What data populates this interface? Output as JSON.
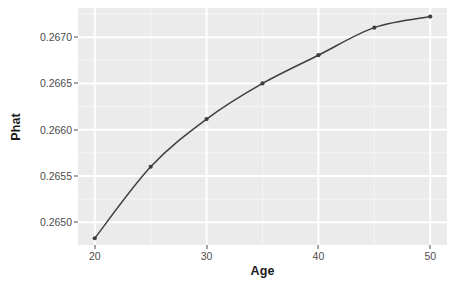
{
  "chart_data": {
    "type": "line",
    "title": "",
    "subtitle": "",
    "xlabel": "Age",
    "ylabel": "Phat",
    "xlim": [
      18.5,
      51.5
    ],
    "ylim": [
      0.264755,
      0.267315
    ],
    "xticks": [
      20,
      30,
      40,
      50
    ],
    "xtick_labels": [
      "20",
      "30",
      "40",
      "50"
    ],
    "yticks": [
      0.265,
      0.2655,
      0.266,
      0.2665,
      0.267
    ],
    "ytick_labels": [
      "0.2650",
      "0.2655",
      "0.2660",
      "0.2665",
      "0.2670"
    ],
    "x_minor_ticks": [
      25,
      35,
      45
    ],
    "y_minor_ticks": [
      0.26475,
      0.26525,
      0.26575,
      0.26625,
      0.26675,
      0.26725
    ],
    "grid": true,
    "legend": "none",
    "x": [
      20,
      25,
      30,
      35,
      40,
      45,
      50
    ],
    "values": [
      0.264828,
      0.2656,
      0.266115,
      0.2665,
      0.266805,
      0.267103,
      0.267222
    ],
    "series": [
      {
        "name": "Phat",
        "x": [
          20,
          25,
          30,
          35,
          40,
          45,
          50
        ],
        "values": [
          0.264828,
          0.2656,
          0.266115,
          0.2665,
          0.266805,
          0.267103,
          0.267222
        ],
        "line_color": "#3f3f3f",
        "point_color": "#3f3f3f",
        "point_shape": "circle"
      }
    ],
    "annotations": []
  },
  "style": {
    "panel_background": "#ebebeb",
    "plot_background": "#ffffff",
    "gridline_major_color": "#ffffff",
    "gridline_minor_color": "#f6f6f6",
    "axis_text_color": "#4d4d4d",
    "axis_title_color": "#1a1a1a",
    "line_color": "#3f3f3f",
    "point_color": "#3f3f3f"
  }
}
